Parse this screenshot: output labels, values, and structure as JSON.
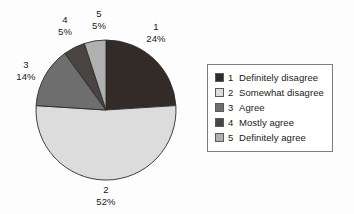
{
  "chart_data": {
    "type": "pie",
    "title": "",
    "legend_position": "right",
    "labels": [
      "1",
      "2",
      "3",
      "4",
      "5"
    ],
    "categories": [
      "Definitely disagree",
      "Somewhat disagree",
      "Agree",
      "Mostly agree",
      "Definitely agree"
    ],
    "values": [
      24,
      52,
      14,
      5,
      5
    ],
    "value_labels": [
      "24%",
      "52%",
      "14%",
      "5%",
      "5%"
    ],
    "units": "percent",
    "start_angle_deg": 0,
    "direction": "clockwise",
    "colors": [
      "#332b28",
      "#dcdcdc",
      "#6e6e6e",
      "#4a4442",
      "#b0b0b0"
    ],
    "slice_edge_color": "#2b2b2b",
    "slices": [
      {
        "key": "1",
        "label": "Definitely disagree",
        "value": 24,
        "value_label": "24%",
        "color": "#332b28"
      },
      {
        "key": "2",
        "label": "Somewhat disagree",
        "value": 52,
        "value_label": "52%",
        "color": "#dcdcdc"
      },
      {
        "key": "3",
        "label": "Agree",
        "value": 14,
        "value_label": "14%",
        "color": "#6e6e6e"
      },
      {
        "key": "4",
        "label": "Mostly agree",
        "value": 5,
        "value_label": "5%",
        "color": "#4a4442"
      },
      {
        "key": "5",
        "label": "Definitely agree",
        "value": 5,
        "value_label": "5%",
        "color": "#b0b0b0"
      }
    ]
  },
  "legend": {
    "items": [
      {
        "key": "1",
        "label": "Definitely disagree",
        "color": "#332b28"
      },
      {
        "key": "2",
        "label": "Somewhat disagree",
        "color": "#dcdcdc"
      },
      {
        "key": "3",
        "label": "Agree",
        "color": "#6e6e6e"
      },
      {
        "key": "4",
        "label": "Mostly agree",
        "color": "#4a4442"
      },
      {
        "key": "5",
        "label": "Definitely agree",
        "color": "#b0b0b0"
      }
    ],
    "border_color": "#7d7d7d",
    "background": "#ffffff"
  },
  "canvas": {
    "background": "#fdfdfd",
    "text_color": "#1a1a1a"
  }
}
